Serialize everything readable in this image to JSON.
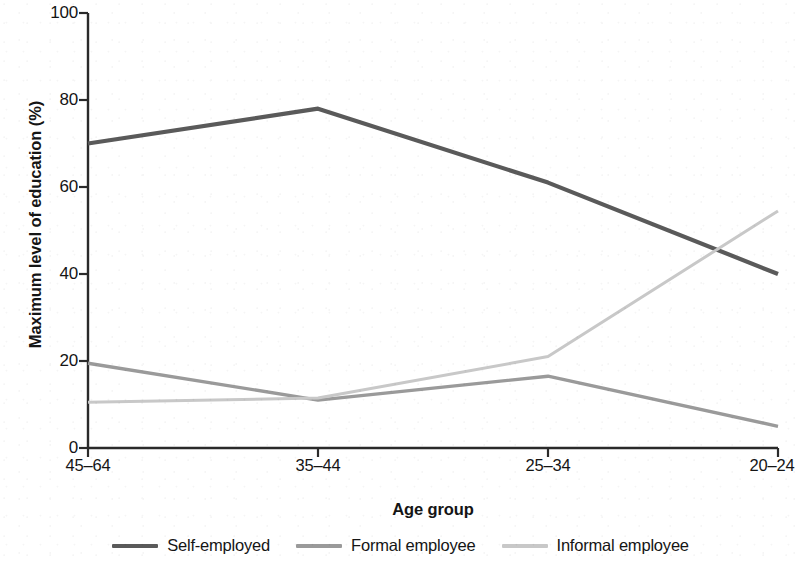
{
  "chart_data": {
    "type": "line",
    "title": "",
    "xlabel": "Age group",
    "ylabel": "Maximum level of education (%)",
    "categories": [
      "45–64",
      "35–44",
      "25–34",
      "20–24"
    ],
    "ylim": [
      0,
      100
    ],
    "yticks": [
      0,
      20,
      40,
      60,
      80,
      100
    ],
    "ytick_labels": [
      "0",
      "20",
      "40",
      "60",
      "80",
      "100"
    ],
    "grid": false,
    "legend_position": "bottom",
    "series": [
      {
        "name": "Self-employed",
        "color": "#5a5a5a",
        "values": [
          70,
          78,
          61,
          40
        ]
      },
      {
        "name": "Formal employee",
        "color": "#9a9a9a",
        "values": [
          19.5,
          11,
          16.5,
          5
        ]
      },
      {
        "name": "Informal employee",
        "color": "#c8c8c8",
        "values": [
          10.5,
          11.5,
          21,
          54.5
        ]
      }
    ]
  },
  "axis": {
    "line_color": "#2a2a2a"
  },
  "legend": {
    "items": [
      {
        "label": "Self-employed",
        "color": "#5a5a5a"
      },
      {
        "label": "Formal employee",
        "color": "#9a9a9a"
      },
      {
        "label": "Informal employee",
        "color": "#c8c8c8"
      }
    ]
  }
}
